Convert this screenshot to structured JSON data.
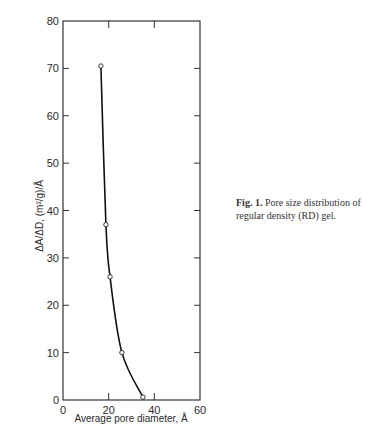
{
  "chart_data": {
    "type": "line",
    "title": "",
    "xlabel": "Average pore diameter, Å",
    "ylabel": "ΔA/ΔD, (m²/g)/Å",
    "xlim": [
      0,
      60
    ],
    "ylim": [
      0,
      80
    ],
    "x_ticks": [
      0,
      20,
      40,
      60
    ],
    "y_ticks": [
      0,
      10,
      20,
      30,
      40,
      50,
      60,
      70,
      80
    ],
    "grid": false,
    "legend": null,
    "series": [
      {
        "name": "RD gel",
        "marker": "open-circle",
        "smooth_curve": true,
        "x": [
          16.6,
          18.8,
          20.6,
          25.8,
          35.0
        ],
        "y": [
          70.5,
          37.0,
          26.0,
          10.0,
          0.6
        ]
      }
    ]
  },
  "caption": {
    "label": "Fig. 1.",
    "text": "Pore size distribution of regular density (RD) gel."
  }
}
